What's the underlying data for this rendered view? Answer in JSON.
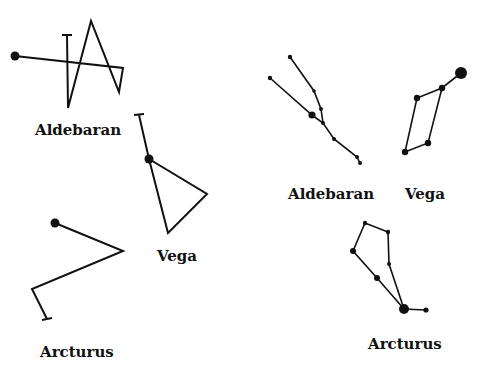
{
  "diagram": {
    "title": "",
    "stroke_color": "#111111",
    "left_panel": {
      "description": "Scrambled constellation drawings",
      "figures": [
        {
          "name": "Aldebaran",
          "label": "Aldebaran"
        },
        {
          "name": "Vega",
          "label": "Vega"
        },
        {
          "name": "Arcturus",
          "label": "Arcturus"
        }
      ]
    },
    "right_panel": {
      "description": "Constellation star maps",
      "figures": [
        {
          "name": "Aldebaran",
          "label": "Aldebaran"
        },
        {
          "name": "Vega",
          "label": "Vega"
        },
        {
          "name": "Arcturus",
          "label": "Arcturus"
        }
      ]
    }
  }
}
